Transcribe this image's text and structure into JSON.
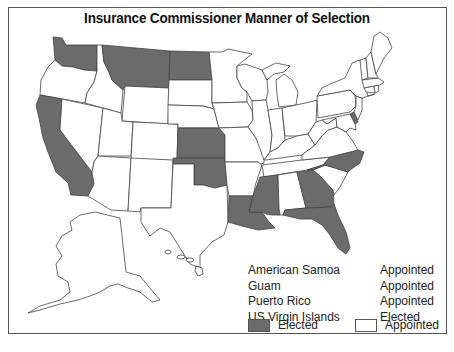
{
  "title": "Insurance Commissioner Manner of Selection",
  "colors": {
    "elected": "#6b6b6b",
    "appointed": "#ffffff",
    "border": "#444444"
  },
  "territories": [
    {
      "name": "American Samoa",
      "method": "Appointed"
    },
    {
      "name": "Guam",
      "method": "Appointed"
    },
    {
      "name": "Puerto Rico",
      "method": "Appointed"
    },
    {
      "name": "US Virgin Islands",
      "method": "Elected"
    }
  ],
  "legend": {
    "elected_label": "Elected",
    "appointed_label": "Appointed"
  },
  "elected_states": [
    "Washington",
    "Montana",
    "North Dakota",
    "California",
    "Kansas",
    "Oklahoma",
    "Louisiana",
    "Mississippi",
    "Georgia",
    "Florida",
    "North Carolina",
    "Delaware"
  ]
}
